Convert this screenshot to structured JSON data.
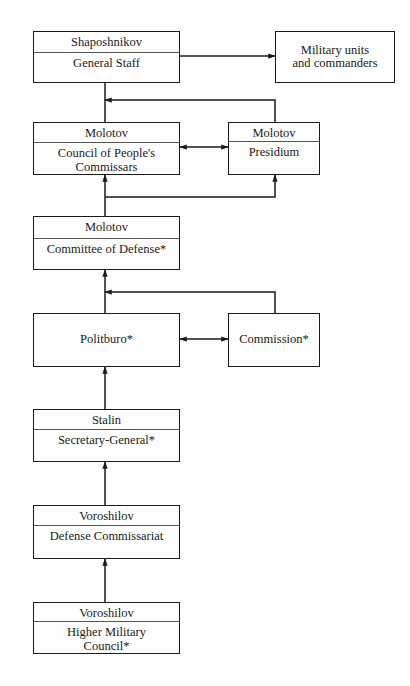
{
  "diagram": {
    "type": "organizational-flowchart",
    "nodes": {
      "general_staff": {
        "person": "Shaposhnikov",
        "body": "General Staff"
      },
      "military_units": {
        "label_line1": "Military units",
        "label_line2": "and commanders"
      },
      "council": {
        "person": "Molotov",
        "body_line1": "Council of People's",
        "body_line2": "Commissars"
      },
      "presidium": {
        "person": "Molotov",
        "body": "Presidium"
      },
      "committee": {
        "person": "Molotov",
        "body": "Committee of Defense*"
      },
      "politburo": {
        "label": "Politburo*"
      },
      "commission": {
        "label": "Commission*"
      },
      "secretary": {
        "person": "Stalin",
        "body": "Secretary-General*"
      },
      "defense_commissariat": {
        "person": "Voroshilov",
        "body": "Defense Commissariat"
      },
      "higher_council": {
        "person": "Voroshilov",
        "body_line1": "Higher Military",
        "body_line2": "Council*"
      }
    },
    "edges": [
      {
        "from": "general_staff",
        "to": "military_units",
        "type": "arrow"
      },
      {
        "from": "presidium",
        "to": "general_staff",
        "type": "arrow"
      },
      {
        "from": "council",
        "to": "general_staff",
        "type": "line"
      },
      {
        "from": "council",
        "to": "presidium",
        "type": "bidirectional"
      },
      {
        "from": "committee",
        "to": "council",
        "type": "arrow"
      },
      {
        "from": "committee",
        "to": "presidium",
        "type": "arrow"
      },
      {
        "from": "commission",
        "to": "committee",
        "type": "arrow"
      },
      {
        "from": "politburo",
        "to": "committee",
        "type": "line"
      },
      {
        "from": "politburo",
        "to": "commission",
        "type": "bidirectional"
      },
      {
        "from": "secretary",
        "to": "politburo",
        "type": "arrow"
      },
      {
        "from": "defense_commissariat",
        "to": "secretary",
        "type": "arrow"
      },
      {
        "from": "higher_council",
        "to": "defense_commissariat",
        "type": "arrow"
      }
    ],
    "colors": {
      "line": "#1a1a1a",
      "background": "#fefefe"
    }
  }
}
